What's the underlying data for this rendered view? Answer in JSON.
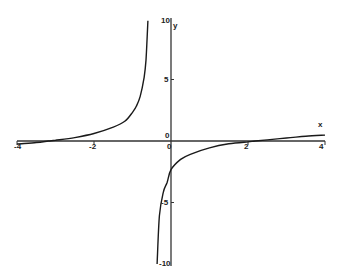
{
  "chart_data": {
    "type": "line",
    "title": "",
    "xlabel": "x",
    "ylabel": "y",
    "xlim": [
      -4,
      4
    ],
    "ylim": [
      -10,
      10
    ],
    "grid": false,
    "legend": null,
    "x_ticks": [
      "-4",
      "-2",
      "0",
      "2",
      "4"
    ],
    "y_ticks": [
      "10",
      "5",
      "0",
      "-5",
      "-10"
    ],
    "origin_label": "0",
    "vertical_asymptote_x": -0.5,
    "series": [
      {
        "name": "left branch",
        "x": [
          -4,
          -3.5,
          -3.19,
          -3,
          -2.5,
          -2,
          -1.5,
          -1.2,
          -1,
          -0.9,
          -0.8,
          -0.7,
          -0.65,
          -0.6
        ],
        "y": [
          -0.24,
          -0.12,
          0,
          0.06,
          0.28,
          0.61,
          1.13,
          1.6,
          2.33,
          2.82,
          3.63,
          5.15,
          6.58,
          9.78
        ]
      },
      {
        "name": "right branch",
        "x": [
          -0.36,
          -0.3,
          -0.2,
          -0.1,
          0,
          0.25,
          0.5,
          1,
          1.5,
          2,
          2.19,
          2.5,
          3,
          3.5,
          4
        ],
        "y": [
          -10.0,
          -6.08,
          -4.17,
          -3.35,
          -2.33,
          -1.5,
          -1.08,
          -0.56,
          -0.23,
          -0.07,
          0,
          0.09,
          0.24,
          0.38,
          0.48
        ]
      }
    ],
    "colors": {
      "curve": "#1a1a1a",
      "axes": "#333333"
    }
  }
}
